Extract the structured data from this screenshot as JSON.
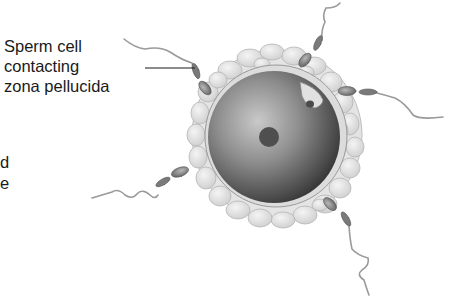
{
  "diagram": {
    "labels": [
      {
        "id": "sperm-contacting-zona",
        "lines": [
          "Sperm cell",
          "contacting",
          "zona pellucida"
        ],
        "points_to": "sperm cell at upper-left of egg"
      },
      {
        "id": "partial-cut-off-label",
        "lines": [
          "d",
          "e"
        ],
        "note": "cropped at left edge"
      }
    ],
    "structures": [
      "egg cell (oocyte)",
      "nucleus",
      "polar body",
      "zona pellucida",
      "corona radiata (follicle cells)",
      "sperm cells"
    ],
    "sperm_count": 5,
    "colors": {
      "background": "#ffffff",
      "text": "#1a1a1a",
      "oocyte_dark": "#3a3a3a",
      "oocyte_light": "#bdbdbd",
      "corona": "#e6e6e6",
      "sperm": "#8a8a8a"
    }
  }
}
